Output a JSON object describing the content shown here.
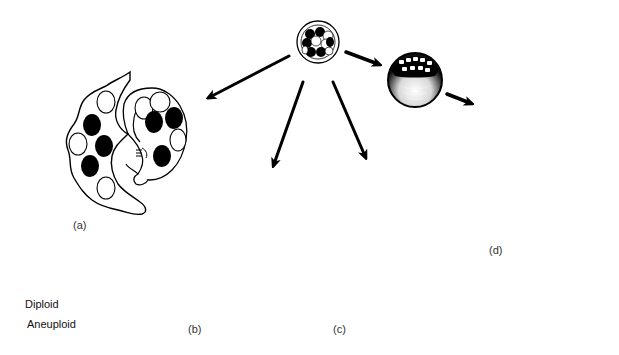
{
  "figure": {
    "panels": [
      {
        "id": "a",
        "label": "(a)",
        "description": "Mixed: outer chorion/placenta with diploid and aneuploid cells; embryo with mixed cells"
      },
      {
        "id": "b",
        "label": "(b)",
        "description": "Placenta mixed; embryo fully diploid"
      },
      {
        "id": "c",
        "label": "(c)",
        "description": "Placenta fully aneuploid; embryo fully diploid"
      },
      {
        "id": "d",
        "label": "(d)",
        "description": "Placenta fully diploid; embryo mixed"
      }
    ],
    "origin": {
      "name": "morula",
      "description": "Early embryo with mixed diploid and aneuploid cells"
    },
    "intermediate": {
      "name": "blastocyst"
    }
  },
  "legend": {
    "items": [
      {
        "label": "Diploid",
        "style": "filled",
        "color": "#000000"
      },
      {
        "label": "Aneuploid",
        "style": "open",
        "color": "#ffffff"
      }
    ]
  },
  "colors": {
    "ink": "#000000",
    "background": "#ffffff",
    "label": "#333333"
  }
}
